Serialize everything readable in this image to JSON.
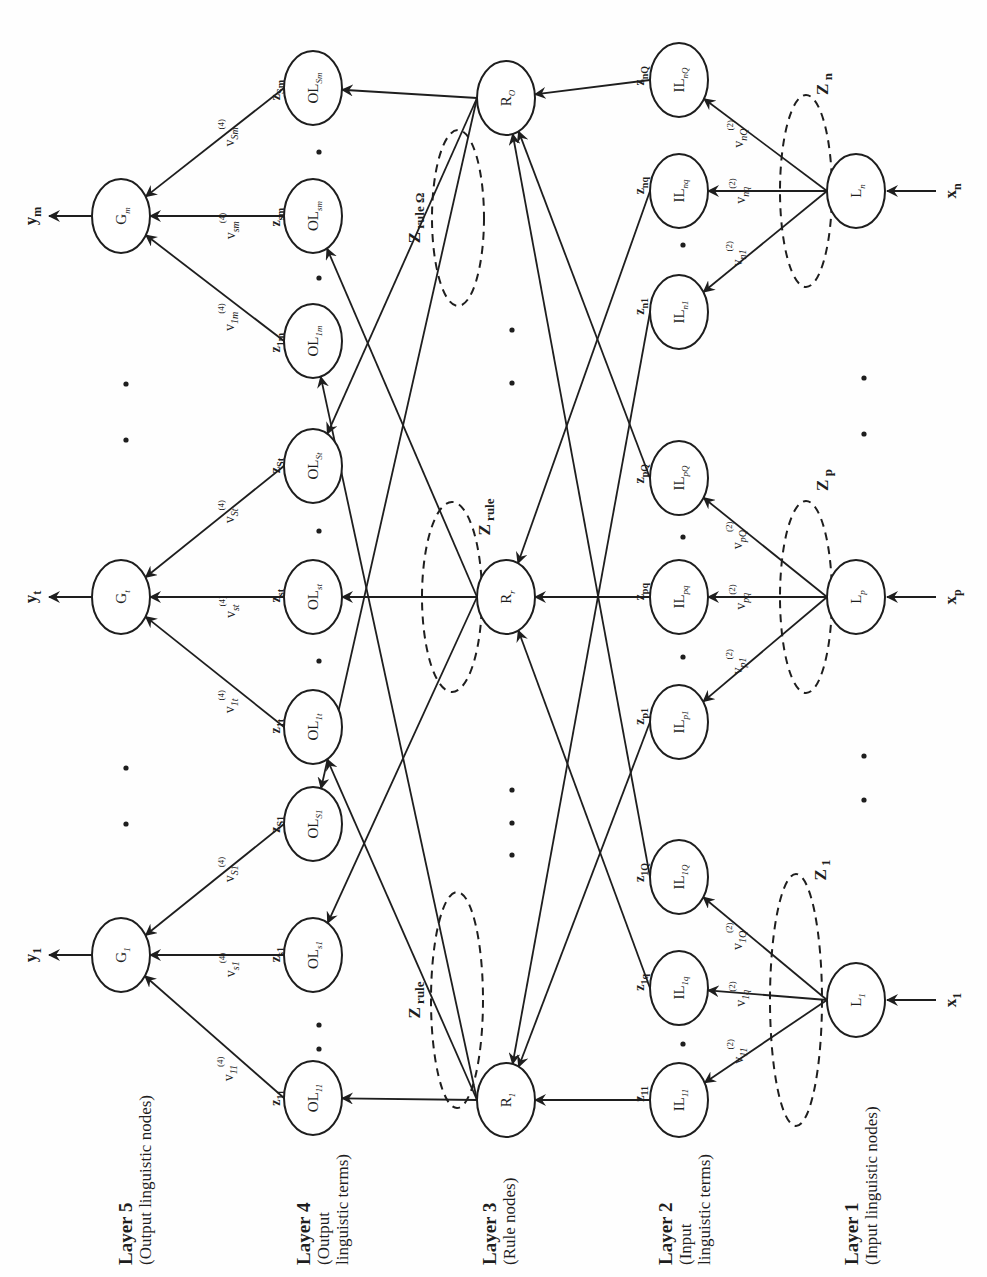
{
  "figure": {
    "orientation": "rotated-90-ccw",
    "colors": {
      "ink": "#1e1e1e",
      "background": "#fefefe"
    }
  },
  "layers": [
    {
      "title": "Layer 5",
      "desc": [
        "(Output linguistic nodes)"
      ],
      "x": 132,
      "y": 1265
    },
    {
      "title": "Layer 4",
      "desc": [
        "(Output",
        "linguistic terms)"
      ],
      "x": 310,
      "y": 1265
    },
    {
      "title": "Layer 3",
      "desc": [
        "(Rule nodes)"
      ],
      "x": 496,
      "y": 1265
    },
    {
      "title": "Layer 2",
      "desc": [
        "(Input",
        "linguistic terms)"
      ],
      "x": 672,
      "y": 1265
    },
    {
      "title": "Layer 1",
      "desc": [
        "(Input linguistic nodes)"
      ],
      "x": 858,
      "y": 1265
    }
  ],
  "nodes": {
    "layer5": [
      {
        "id": "G1",
        "base": "G",
        "sub": "1",
        "cx": 121,
        "cy": 955
      },
      {
        "id": "Gt",
        "base": "G",
        "sub": "t",
        "cx": 121,
        "cy": 597
      },
      {
        "id": "Gm",
        "base": "G",
        "sub": "m",
        "cx": 121,
        "cy": 216
      }
    ],
    "layer4": [
      {
        "id": "OL11",
        "base": "OL",
        "sub": "11",
        "cx": 313,
        "cy": 1098
      },
      {
        "id": "OLs1",
        "base": "OL",
        "sub": "s1",
        "cx": 313,
        "cy": 955
      },
      {
        "id": "OLS1",
        "base": "OL",
        "sub": "S1",
        "cx": 313,
        "cy": 824
      },
      {
        "id": "OL1t",
        "base": "OL",
        "sub": "1t",
        "cx": 313,
        "cy": 727
      },
      {
        "id": "OLst",
        "base": "OL",
        "sub": "st",
        "cx": 313,
        "cy": 597
      },
      {
        "id": "OLSt",
        "base": "OL",
        "sub": "St",
        "cx": 313,
        "cy": 466
      },
      {
        "id": "OL1m",
        "base": "OL",
        "sub": "1m",
        "cx": 313,
        "cy": 341
      },
      {
        "id": "OLsm",
        "base": "OL",
        "sub": "sm",
        "cx": 313,
        "cy": 216
      },
      {
        "id": "OLSm",
        "base": "OL",
        "sub": "Sm",
        "cx": 313,
        "cy": 88
      }
    ],
    "layer3": [
      {
        "id": "R1",
        "base": "R",
        "sub": "1",
        "cx": 506,
        "cy": 1100
      },
      {
        "id": "Rr",
        "base": "R",
        "sub": "r",
        "cx": 506,
        "cy": 597
      },
      {
        "id": "RO",
        "base": "R",
        "sub": "O",
        "cx": 506,
        "cy": 98
      }
    ],
    "layer2": [
      {
        "id": "IL11",
        "base": "IL",
        "sub": "11",
        "cx": 679,
        "cy": 1100
      },
      {
        "id": "IL1q",
        "base": "IL",
        "sub": "1q",
        "cx": 679,
        "cy": 988
      },
      {
        "id": "IL1Q",
        "base": "IL",
        "sub": "1Q",
        "cx": 679,
        "cy": 877
      },
      {
        "id": "ILp1",
        "base": "IL",
        "sub": "p1",
        "cx": 679,
        "cy": 722
      },
      {
        "id": "ILpq",
        "base": "IL",
        "sub": "pq",
        "cx": 679,
        "cy": 597
      },
      {
        "id": "ILpQ",
        "base": "IL",
        "sub": "pQ",
        "cx": 679,
        "cy": 478
      },
      {
        "id": "ILn1",
        "base": "IL",
        "sub": "n1",
        "cx": 679,
        "cy": 312
      },
      {
        "id": "ILnq",
        "base": "IL",
        "sub": "nq",
        "cx": 679,
        "cy": 191
      },
      {
        "id": "ILnQ",
        "base": "IL",
        "sub": "nQ",
        "cx": 679,
        "cy": 80
      }
    ],
    "layer1": [
      {
        "id": "L1",
        "base": "L",
        "sub": "1",
        "cx": 856,
        "cy": 1000
      },
      {
        "id": "Lp",
        "base": "L",
        "sub": "p",
        "cx": 856,
        "cy": 597
      },
      {
        "id": "Ln",
        "base": "L",
        "sub": "n",
        "cx": 856,
        "cy": 191
      }
    ]
  },
  "inputs": [
    {
      "label": "x",
      "sub": "1",
      "to": "L1"
    },
    {
      "label": "x",
      "sub": "p",
      "to": "Lp"
    },
    {
      "label": "x",
      "sub": "n",
      "to": "Ln"
    }
  ],
  "outputs": [
    {
      "label": "y",
      "sub": "1",
      "from": "G1"
    },
    {
      "label": "y",
      "sub": "t",
      "from": "Gt"
    },
    {
      "label": "y",
      "sub": "m",
      "from": "Gm"
    }
  ],
  "layer1_to_layer2": [
    {
      "from": "L1",
      "to": "IL11",
      "weight": "v",
      "sub": "11",
      "sup": "(2)"
    },
    {
      "from": "L1",
      "to": "IL1q",
      "weight": "v",
      "sub": "1q",
      "sup": "(2)"
    },
    {
      "from": "L1",
      "to": "IL1Q",
      "weight": "v",
      "sub": "1Q",
      "sup": "(2)"
    },
    {
      "from": "Lp",
      "to": "ILp1",
      "weight": "v",
      "sub": "p1",
      "sup": "(2)"
    },
    {
      "from": "Lp",
      "to": "ILpq",
      "weight": "v",
      "sub": "pq",
      "sup": "(2)"
    },
    {
      "from": "Lp",
      "to": "ILpQ",
      "weight": "v",
      "sub": "pQ",
      "sup": "(2)"
    },
    {
      "from": "Ln",
      "to": "ILn1",
      "weight": "v",
      "sub": "n1",
      "sup": "(2)"
    },
    {
      "from": "Ln",
      "to": "ILnq",
      "weight": "v",
      "sub": "nq",
      "sup": "(2)"
    },
    {
      "from": "Ln",
      "to": "ILnQ",
      "weight": "v",
      "sub": "nQ",
      "sup": "(2)"
    }
  ],
  "layer2_outputs": [
    {
      "node": "IL11",
      "z": "z",
      "sub": "11"
    },
    {
      "node": "IL1q",
      "z": "z",
      "sub": "1q"
    },
    {
      "node": "IL1Q",
      "z": "z",
      "sub": "1Q"
    },
    {
      "node": "ILp1",
      "z": "z",
      "sub": "p1"
    },
    {
      "node": "ILpq",
      "z": "z",
      "sub": "pq"
    },
    {
      "node": "ILpQ",
      "z": "z",
      "sub": "pQ"
    },
    {
      "node": "ILn1",
      "z": "z",
      "sub": "n1"
    },
    {
      "node": "ILnq",
      "z": "z",
      "sub": "nq"
    },
    {
      "node": "ILnQ",
      "z": "z",
      "sub": "nQ"
    }
  ],
  "layer2_to_layer3": [
    {
      "from": "IL11",
      "to": "R1"
    },
    {
      "from": "ILp1",
      "to": "R1"
    },
    {
      "from": "ILn1",
      "to": "R1"
    },
    {
      "from": "IL1q",
      "to": "Rr"
    },
    {
      "from": "ILpq",
      "to": "Rr"
    },
    {
      "from": "ILnq",
      "to": "Rr"
    },
    {
      "from": "IL1Q",
      "to": "RO"
    },
    {
      "from": "ILpQ",
      "to": "RO"
    },
    {
      "from": "ILnQ",
      "to": "RO"
    }
  ],
  "layer3_to_layer4": [
    {
      "from": "R1",
      "to": "OL11"
    },
    {
      "from": "R1",
      "to": "OL1t"
    },
    {
      "from": "R1",
      "to": "OL1m"
    },
    {
      "from": "Rr",
      "to": "OLs1"
    },
    {
      "from": "Rr",
      "to": "OLst"
    },
    {
      "from": "Rr",
      "to": "OLsm"
    },
    {
      "from": "RO",
      "to": "OLS1"
    },
    {
      "from": "RO",
      "to": "OLSt"
    },
    {
      "from": "RO",
      "to": "OLSm"
    }
  ],
  "layer4_outputs": [
    {
      "node": "OL11",
      "z": "z",
      "sub": "11"
    },
    {
      "node": "OLs1",
      "z": "z",
      "sub": "s1"
    },
    {
      "node": "OLS1",
      "z": "z",
      "sub": "S1"
    },
    {
      "node": "OL1t",
      "z": "z",
      "sub": "1t"
    },
    {
      "node": "OLst",
      "z": "z",
      "sub": "st"
    },
    {
      "node": "OLSt",
      "z": "z",
      "sub": "St"
    },
    {
      "node": "OL1m",
      "z": "z",
      "sub": "1m"
    },
    {
      "node": "OLsm",
      "z": "z",
      "sub": "sm"
    },
    {
      "node": "OLSm",
      "z": "z",
      "sub": "Sm"
    }
  ],
  "layer4_to_layer5": [
    {
      "from": "OL11",
      "to": "G1",
      "weight": "v",
      "sub": "11",
      "sup": "(4)"
    },
    {
      "from": "OLs1",
      "to": "G1",
      "weight": "v",
      "sub": "s1",
      "sup": "(4)"
    },
    {
      "from": "OLS1",
      "to": "G1",
      "weight": "v",
      "sub": "S1",
      "sup": "(4)"
    },
    {
      "from": "OL1t",
      "to": "Gt",
      "weight": "v",
      "sub": "1t",
      "sup": "(4)"
    },
    {
      "from": "OLst",
      "to": "Gt",
      "weight": "v",
      "sub": "st",
      "sup": "(4)"
    },
    {
      "from": "OLSt",
      "to": "Gt",
      "weight": "v",
      "sub": "St",
      "sup": "(4)"
    },
    {
      "from": "OL1m",
      "to": "Gm",
      "weight": "v",
      "sub": "1m",
      "sup": "(4)"
    },
    {
      "from": "OLsm",
      "to": "Gm",
      "weight": "v",
      "sub": "sm",
      "sup": "(4)"
    },
    {
      "from": "OLSm",
      "to": "Gm",
      "weight": "v",
      "sub": "Sm",
      "sup": "(4)"
    }
  ],
  "groupings": [
    {
      "label": "Z 1",
      "cx": 796,
      "cy": 1000,
      "rx": 26,
      "ry": 126,
      "lx": 826,
      "ly": 870
    },
    {
      "label": "Z p",
      "cx": 806,
      "cy": 597,
      "rx": 26,
      "ry": 96,
      "lx": 828,
      "ly": 480
    },
    {
      "label": "Z n",
      "cx": 806,
      "cy": 191,
      "rx": 26,
      "ry": 96,
      "lx": 828,
      "ly": 84
    },
    {
      "label": "Z rule",
      "cx": 457,
      "cy": 1000,
      "rx": 26,
      "ry": 108,
      "lx": 420,
      "ly": 1000
    },
    {
      "label": "Z rule",
      "cx": 452,
      "cy": 597,
      "rx": 30,
      "ry": 95,
      "lx": 490,
      "ly": 517
    },
    {
      "label": "Z rule Ω",
      "cx": 458,
      "cy": 218,
      "rx": 26,
      "ry": 88,
      "lx": 420,
      "ly": 218
    }
  ],
  "ellipsis_dots": [
    {
      "x": 126,
      "y": 824
    },
    {
      "x": 126,
      "y": 768
    },
    {
      "x": 126,
      "y": 440
    },
    {
      "x": 126,
      "y": 384
    },
    {
      "x": 864,
      "y": 800
    },
    {
      "x": 864,
      "y": 756
    },
    {
      "x": 864,
      "y": 434
    },
    {
      "x": 864,
      "y": 378
    },
    {
      "x": 512,
      "y": 855
    },
    {
      "x": 512,
      "y": 823
    },
    {
      "x": 512,
      "y": 790
    },
    {
      "x": 512,
      "y": 383
    },
    {
      "x": 512,
      "y": 330
    },
    {
      "x": 319,
      "y": 1025
    },
    {
      "x": 319,
      "y": 1049
    },
    {
      "x": 319,
      "y": 661
    },
    {
      "x": 319,
      "y": 531
    },
    {
      "x": 319,
      "y": 278
    },
    {
      "x": 319,
      "y": 152
    },
    {
      "x": 683,
      "y": 1044
    },
    {
      "x": 683,
      "y": 657
    },
    {
      "x": 683,
      "y": 537
    },
    {
      "x": 683,
      "y": 245
    }
  ]
}
